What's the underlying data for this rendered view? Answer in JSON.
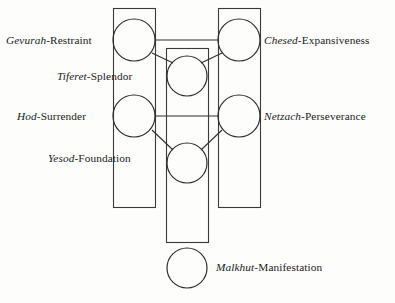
{
  "diagram": {
    "colors": {
      "background": "#fdfdfc",
      "stroke": "#2e2e2e",
      "pillar_stroke": "#3a3a3a",
      "text": "#1b1b1b"
    },
    "nodes": [
      {
        "id": "gevurah",
        "hebrew": "Gevurah",
        "separator": "-",
        "english": "Restraint",
        "full_label": "Gevurah-Restraint",
        "side": "left"
      },
      {
        "id": "chesed",
        "hebrew": "Chesed",
        "separator": "-",
        "english": "Expansiveness",
        "full_label": "Chesed-Expansiveness",
        "side": "right"
      },
      {
        "id": "tiferet",
        "hebrew": "Tiferet",
        "separator": "-",
        "english": "Splendor",
        "full_label": "Tiferet-Splendor",
        "side": "left"
      },
      {
        "id": "hod",
        "hebrew": "Hod",
        "separator": "-",
        "english": "Surrender",
        "full_label": "Hod-Surrender",
        "side": "left"
      },
      {
        "id": "netzach",
        "hebrew": "Netzach",
        "separator": "-",
        "english": "Perseverance",
        "full_label": "Netzach-Perseverance",
        "side": "right"
      },
      {
        "id": "yesod",
        "hebrew": "Yesod",
        "separator": "-",
        "english": "Foundation",
        "full_label": "Yesod-Foundation",
        "side": "left"
      },
      {
        "id": "malkhut",
        "hebrew": "Malkhut",
        "separator": "-",
        "english": "Manifestation",
        "full_label": "Malkhut-Manifestation",
        "side": "right"
      }
    ],
    "pillars": [
      {
        "id": "left-pillar",
        "name": "Pillar of Severity"
      },
      {
        "id": "middle-pillar",
        "name": "Pillar of Equilibrium"
      },
      {
        "id": "right-pillar",
        "name": "Pillar of Mercy"
      }
    ]
  }
}
